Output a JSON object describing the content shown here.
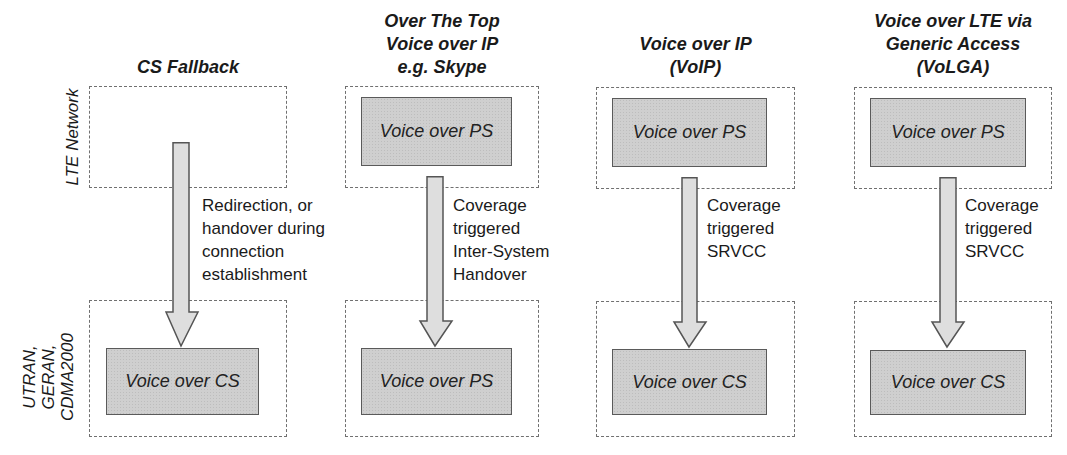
{
  "row_labels": {
    "top": "LTE Network",
    "bottom": [
      "UTRAN,",
      "GERAN,",
      "CDMA2000"
    ]
  },
  "columns": [
    {
      "heading": [
        "CS Fallback"
      ],
      "top_box": "",
      "transition": [
        "Redirection, or",
        "handover during",
        "connection",
        "establishment"
      ],
      "bottom_box": "Voice over CS"
    },
    {
      "heading": [
        "Over The Top",
        "Voice over IP",
        "e.g. Skype"
      ],
      "top_box": "Voice over PS",
      "transition": [
        "Coverage",
        "triggered",
        "Inter-System",
        "Handover"
      ],
      "bottom_box": "Voice over PS"
    },
    {
      "heading": [
        "Voice over IP",
        "(VoIP)"
      ],
      "top_box": "Voice over PS",
      "transition": [
        "Coverage",
        "triggered",
        "SRVCC"
      ],
      "bottom_box": "Voice over CS"
    },
    {
      "heading": [
        "Voice over LTE via",
        "Generic Access",
        "(VoLGA)"
      ],
      "top_box": "Voice over PS",
      "transition": [
        "Coverage",
        "triggered",
        "SRVCC"
      ],
      "bottom_box": "Voice over CS"
    }
  ],
  "colors": {
    "zone_border": "#707070",
    "box_fill": "#cfcfcf",
    "box_border": "#5a5a5a",
    "arrow_fill": "#dedede",
    "arrow_border": "#555555"
  }
}
